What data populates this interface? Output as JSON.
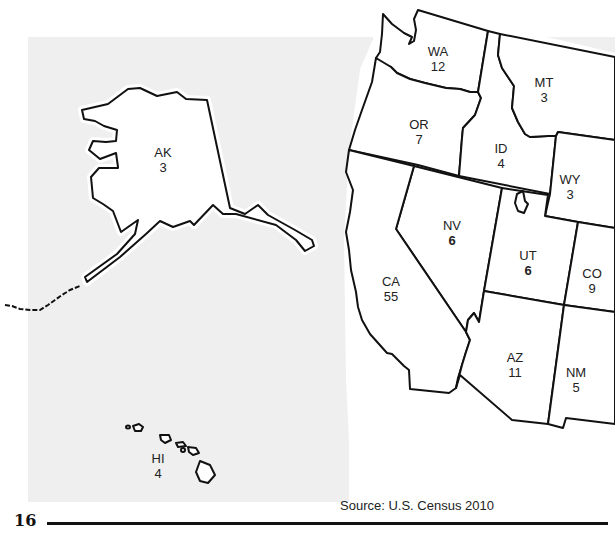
{
  "map": {
    "subject": "Electoral votes by state (western U.S.)",
    "states": [
      {
        "abbr": "WA",
        "value": "12",
        "bold": false
      },
      {
        "abbr": "OR",
        "value": "7",
        "bold": false
      },
      {
        "abbr": "ID",
        "value": "4",
        "bold": false
      },
      {
        "abbr": "MT",
        "value": "3",
        "bold": false
      },
      {
        "abbr": "WY",
        "value": "3",
        "bold": false
      },
      {
        "abbr": "NV",
        "value": "6",
        "bold": true
      },
      {
        "abbr": "UT",
        "value": "6",
        "bold": true
      },
      {
        "abbr": "CO",
        "value": "9",
        "bold": false
      },
      {
        "abbr": "CA",
        "value": "55",
        "bold": false
      },
      {
        "abbr": "AZ",
        "value": "11",
        "bold": false
      },
      {
        "abbr": "NM",
        "value": "5",
        "bold": false
      },
      {
        "abbr": "AK",
        "value": "3",
        "bold": false
      },
      {
        "abbr": "HI",
        "value": "4",
        "bold": false
      }
    ]
  },
  "footer": {
    "page_number": "16",
    "source": "Source: U.S. Census 2010"
  },
  "colors": {
    "background_panel": "#efefef",
    "state_fill": "#ffffff",
    "state_stroke": "#111111"
  }
}
